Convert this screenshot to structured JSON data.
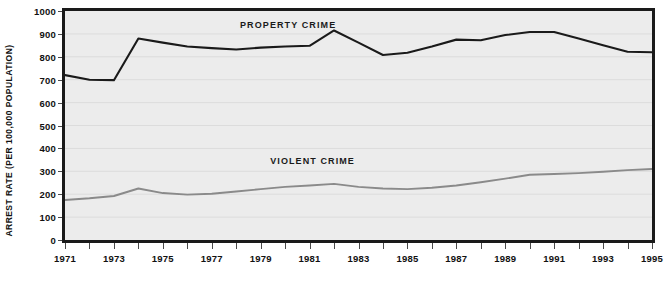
{
  "chart_data": {
    "type": "line",
    "title": "",
    "xlabel": "",
    "ylabel": "ARREST RATE (PER 100,000 POPULATION)",
    "xlim": [
      1971,
      1995
    ],
    "ylim": [
      0,
      1000
    ],
    "grid": true,
    "legend_position": "inline-labels",
    "x": [
      1971,
      1972,
      1973,
      1974,
      1975,
      1976,
      1977,
      1978,
      1979,
      1980,
      1981,
      1982,
      1983,
      1984,
      1985,
      1986,
      1987,
      1988,
      1989,
      1990,
      1991,
      1992,
      1993,
      1994,
      1995
    ],
    "y_ticks": [
      0,
      100,
      200,
      300,
      400,
      500,
      600,
      700,
      800,
      900,
      1000
    ],
    "y_tick_labels": [
      "0",
      "100",
      "200",
      "300",
      "400",
      "500",
      "600",
      "700",
      "800",
      "900",
      "1000"
    ],
    "x_ticks": [
      1971,
      1972,
      1973,
      1974,
      1975,
      1976,
      1977,
      1978,
      1979,
      1980,
      1981,
      1982,
      1983,
      1984,
      1985,
      1986,
      1987,
      1988,
      1989,
      1990,
      1991,
      1992,
      1993,
      1994,
      1995
    ],
    "x_tick_labels": [
      "1971",
      "",
      "1973",
      "",
      "1975",
      "",
      "1977",
      "",
      "1979",
      "",
      "1981",
      "",
      "1983",
      "",
      "1985",
      "",
      "1987",
      "",
      "1989",
      "",
      "1991",
      "",
      "1993",
      "",
      "1995"
    ],
    "series": [
      {
        "name": "PROPERTY CRIME",
        "color": "#1a1a1a",
        "values": [
          720,
          700,
          698,
          880,
          862,
          845,
          838,
          832,
          840,
          845,
          848,
          915,
          862,
          808,
          818,
          845,
          875,
          872,
          895,
          908,
          908,
          880,
          850,
          822,
          820
        ],
        "label_x": 1980,
        "label_y": 948
      },
      {
        "name": "VIOLENT CRIME",
        "color": "#8a8a8a",
        "values": [
          175,
          182,
          192,
          225,
          205,
          198,
          202,
          212,
          222,
          232,
          238,
          245,
          232,
          225,
          222,
          228,
          238,
          252,
          268,
          285,
          288,
          292,
          298,
          305,
          310
        ],
        "label_x": 1981,
        "label_y": 352
      }
    ]
  }
}
